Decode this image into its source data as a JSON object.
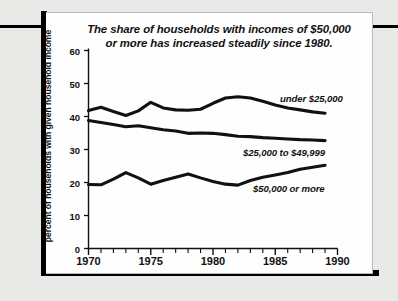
{
  "chart_data": {
    "type": "line",
    "title": "The share of households with incomes of $50,000 or more has increased steadily since 1980.",
    "title_line1": "The share of households with incomes of $50,000",
    "title_line2": "or more has increased steadily since 1980.",
    "xlabel": "",
    "ylabel": "percent of households with given household income",
    "xlim": [
      1970,
      1990
    ],
    "ylim": [
      0,
      60
    ],
    "ytick_labels": [
      "60",
      "50",
      "40",
      "30",
      "20",
      "10",
      "0"
    ],
    "yticks": [
      60,
      50,
      40,
      30,
      20,
      10,
      0
    ],
    "xtick_labels": [
      "1970",
      "1975",
      "1980",
      "1985",
      "1990"
    ],
    "xticks": [
      1970,
      1975,
      1980,
      1985,
      1990
    ],
    "x_minor_tick_step": 1,
    "grid": false,
    "legend_position": "inline-right",
    "line_color": "#111111",
    "background_color": "#fefefe",
    "x": [
      1970,
      1971,
      1972,
      1973,
      1974,
      1975,
      1976,
      1977,
      1978,
      1979,
      1980,
      1981,
      1982,
      1983,
      1984,
      1985,
      1986,
      1987,
      1988,
      1989
    ],
    "series": [
      {
        "name": "under $25,000",
        "label": "under $25,000",
        "values": [
          41.8,
          42.8,
          41.5,
          40.3,
          41.7,
          44.3,
          42.6,
          42.0,
          41.9,
          42.2,
          44.0,
          45.6,
          46.0,
          45.6,
          44.6,
          43.5,
          42.6,
          42.0,
          41.4,
          41.0
        ]
      },
      {
        "name": "$25,000 to $49,999",
        "label": "$25,000 to $49,999",
        "values": [
          38.8,
          38.2,
          37.6,
          36.9,
          37.2,
          36.6,
          36.0,
          35.6,
          34.9,
          35.0,
          34.9,
          34.5,
          34.0,
          33.9,
          33.6,
          33.4,
          33.2,
          33.0,
          32.9,
          32.7
        ]
      },
      {
        "name": "$50,000 or more",
        "label": "$50,000 or more",
        "values": [
          19.4,
          19.3,
          21.0,
          23.0,
          21.4,
          19.5,
          20.6,
          21.6,
          22.6,
          21.4,
          20.3,
          19.5,
          19.2,
          20.6,
          21.6,
          22.3,
          23.0,
          24.0,
          24.6,
          25.2
        ]
      }
    ],
    "series_label_positions": [
      {
        "label_key": 0,
        "left": 280,
        "top": 93
      },
      {
        "label_key": 1,
        "left": 243,
        "top": 147
      },
      {
        "label_key": 2,
        "left": 253,
        "top": 183
      }
    ]
  }
}
